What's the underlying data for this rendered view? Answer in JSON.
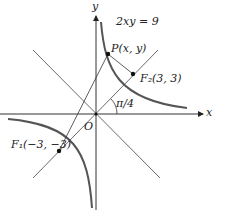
{
  "diagram": {
    "equation": "2xy = 9",
    "point_p": "P(x, y)",
    "focus2": "F₂(3, 3)",
    "focus1": "F₁(−3, −3)",
    "origin": "O",
    "x_axis": "x",
    "y_axis": "y",
    "angle": "π/4",
    "colors": {
      "curve": "#555555",
      "line": "#333333"
    }
  }
}
